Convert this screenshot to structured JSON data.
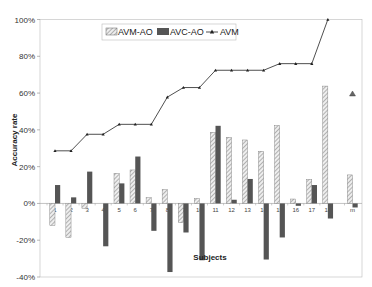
{
  "chart_data": {
    "type": "bar",
    "title": "",
    "xlabel": "Subjects",
    "ylabel": "Accuracy rate",
    "ylim": [
      -0.4,
      1.0
    ],
    "yticks": [
      "-40%",
      "-20%",
      "0%",
      "20%",
      "40%",
      "60%",
      "80%",
      "100%"
    ],
    "categories": [
      "1",
      "2",
      "3",
      "4",
      "5",
      "6",
      "7",
      "8",
      "9",
      "10",
      "11",
      "12",
      "13",
      "14",
      "15",
      "16",
      "17",
      "18",
      "m"
    ],
    "series": [
      {
        "name": "AVM-AO",
        "type": "bar",
        "pattern": "hatched",
        "color": "#d9d9d9",
        "values": [
          -0.12,
          -0.185,
          -0.027,
          0.0,
          0.164,
          0.182,
          0.031,
          0.075,
          -0.105,
          0.027,
          0.387,
          0.36,
          0.345,
          0.284,
          0.424,
          0.024,
          0.131,
          0.638,
          0.155
        ]
      },
      {
        "name": "AVC-AO",
        "type": "bar",
        "pattern": "solid",
        "color": "#555555",
        "values": [
          0.1,
          0.033,
          0.173,
          -0.233,
          0.109,
          0.255,
          -0.149,
          -0.373,
          -0.158,
          -0.309,
          0.422,
          0.02,
          0.133,
          -0.305,
          -0.185,
          -0.013,
          0.1,
          -0.082,
          -0.022
        ]
      },
      {
        "name": "AVM",
        "type": "line",
        "marker": "triangle",
        "color": "#222222",
        "values": [
          0.286,
          0.286,
          0.376,
          0.376,
          0.43,
          0.43,
          0.43,
          0.578,
          0.63,
          0.63,
          0.724,
          0.724,
          0.724,
          0.724,
          0.76,
          0.76,
          0.76,
          1.0,
          0.595
        ]
      }
    ],
    "legend": {
      "position": "top-left-inside",
      "entries": [
        "AVM-AO",
        "AVC-AO",
        "AVM"
      ]
    },
    "grid": false
  }
}
